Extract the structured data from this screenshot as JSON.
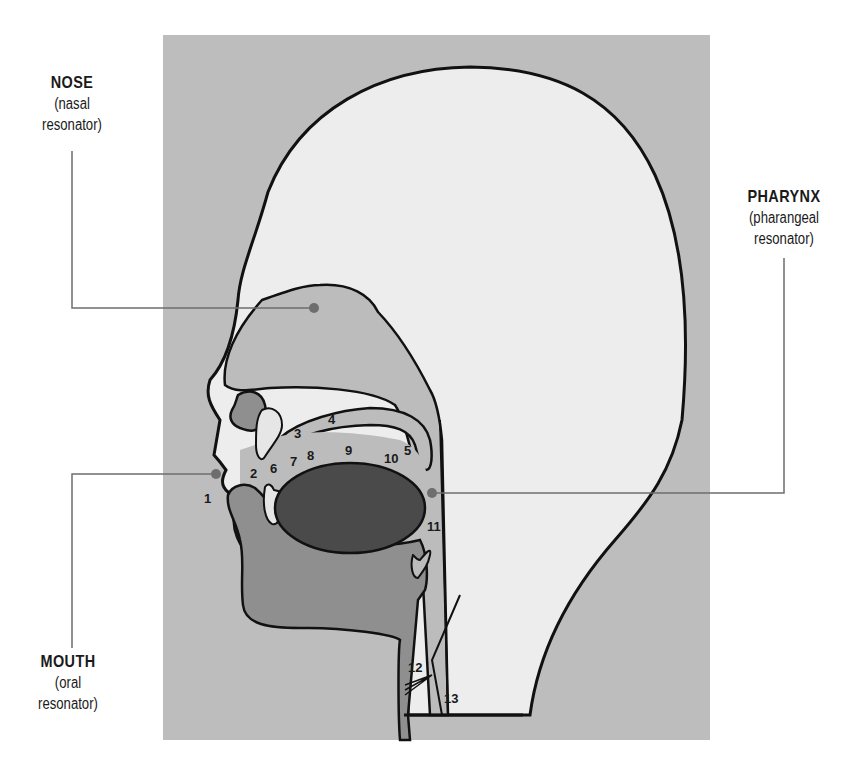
{
  "colors": {
    "frame": "#bdbdbd",
    "head": "#ededed",
    "cavity": "#bcbcbc",
    "tissue": "#8f8f8f",
    "tongue": "#4a4a4a",
    "teeth": "#e6e6e6",
    "outline": "#111111",
    "leader": "#6e6e6e"
  },
  "callouts": {
    "nose": {
      "title": "NOSE",
      "line1": "(nasal",
      "line2": "resonator)"
    },
    "pharynx": {
      "title": "PHARYNX",
      "line1": "(pharangeal",
      "line2": "resonator)"
    },
    "mouth": {
      "title": "MOUTH",
      "line1": "(oral",
      "line2": "resonator)"
    }
  },
  "numbers": [
    "1",
    "2",
    "3",
    "4",
    "5",
    "6",
    "7",
    "8",
    "9",
    "10",
    "11",
    "12",
    "13"
  ]
}
